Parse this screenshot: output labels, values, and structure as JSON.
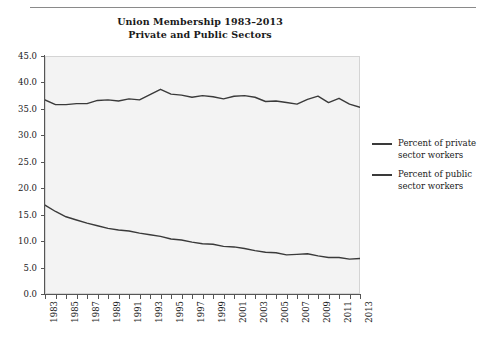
{
  "figure": {
    "title_lines": [
      "Union Membership 1983–2013",
      "Private and Public Sectors"
    ],
    "has_top_rule": true,
    "plot_bg_color": "#f3f3f3",
    "line_color": "#3a3a3a",
    "axis_color": "#555555"
  },
  "legend": {
    "position": "right",
    "entries": [
      {
        "label_line1": "Percent of private",
        "label_line2": "sector workers",
        "color": "#3a3a3a"
      },
      {
        "label_line1": "Percent of public",
        "label_line2": "sector workers",
        "color": "#3a3a3a"
      }
    ]
  },
  "chart_data": {
    "type": "line",
    "title": "Union Membership 1983–2013 Private and Public Sectors",
    "xlabel": "",
    "ylabel": "",
    "ylim": [
      0.0,
      45.0
    ],
    "ytick_labels": [
      "0.0",
      "5.0",
      "10.0",
      "15.0",
      "20.0",
      "25.0",
      "30.0",
      "35.0",
      "40.0",
      "45.0"
    ],
    "ytick_values": [
      0.0,
      5.0,
      10.0,
      15.0,
      20.0,
      25.0,
      30.0,
      35.0,
      40.0,
      45.0
    ],
    "grid": false,
    "legend_position": "right",
    "x": [
      1983,
      1984,
      1985,
      1986,
      1987,
      1988,
      1989,
      1990,
      1991,
      1992,
      1993,
      1994,
      1995,
      1996,
      1997,
      1998,
      1999,
      2000,
      2001,
      2002,
      2003,
      2004,
      2005,
      2006,
      2007,
      2008,
      2009,
      2010,
      2011,
      2012,
      2013
    ],
    "xtick_labels": [
      "1983",
      "1985",
      "1987",
      "1989",
      "1991",
      "1993",
      "1995",
      "1997",
      "1999",
      "2001",
      "2003",
      "2005",
      "2007",
      "2009",
      "2011",
      "2013"
    ],
    "xtick_values": [
      1983,
      1985,
      1987,
      1989,
      1991,
      1993,
      1995,
      1997,
      1999,
      2001,
      2003,
      2005,
      2007,
      2009,
      2011,
      2013
    ],
    "minor_xticks_every": 1,
    "series": [
      {
        "name": "Percent of private sector workers",
        "color": "#3a3a3a",
        "values": [
          16.8,
          15.6,
          14.6,
          14.0,
          13.4,
          12.9,
          12.4,
          12.1,
          11.9,
          11.5,
          11.2,
          10.9,
          10.4,
          10.2,
          9.8,
          9.5,
          9.4,
          9.0,
          8.9,
          8.6,
          8.2,
          7.9,
          7.8,
          7.4,
          7.5,
          7.6,
          7.2,
          6.9,
          6.9,
          6.6,
          6.7
        ]
      },
      {
        "name": "Percent of public sector workers",
        "color": "#3a3a3a",
        "values": [
          36.7,
          35.8,
          35.8,
          36.0,
          36.0,
          36.6,
          36.7,
          36.5,
          36.9,
          36.7,
          37.7,
          38.7,
          37.8,
          37.6,
          37.2,
          37.5,
          37.3,
          36.9,
          37.4,
          37.5,
          37.2,
          36.4,
          36.5,
          36.2,
          35.9,
          36.8,
          37.4,
          36.2,
          37.0,
          35.9,
          35.3
        ]
      }
    ]
  }
}
